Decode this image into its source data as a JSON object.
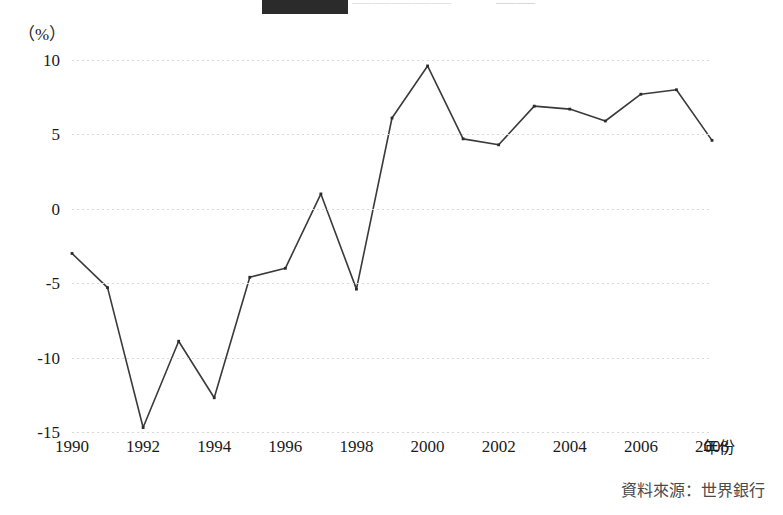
{
  "figure": {
    "unit_label": "（%）",
    "x_axis_name": "年份",
    "source_note": "資料來源：世界銀行",
    "title_fragment_visible": "",
    "line_color": "#3a3a3a",
    "marker_color": "#2b2b2b",
    "grid_color": "#d9d9d9",
    "background": "#ffffff"
  },
  "chart_data": {
    "type": "line",
    "title": "",
    "xlabel": "年份",
    "ylabel": "（%）",
    "ylim": [
      -15,
      10
    ],
    "xlim": [
      1990,
      2008
    ],
    "grid": true,
    "legend": "none",
    "yticks": [
      10,
      5,
      0,
      -5,
      -10,
      -15
    ],
    "ytick_labels": [
      "10",
      "5",
      "0",
      "-5",
      "-10",
      "-15"
    ],
    "xticks": [
      1990,
      1992,
      1994,
      1996,
      1998,
      2000,
      2002,
      2004,
      2006,
      2008
    ],
    "xtick_labels": [
      "1990",
      "1992",
      "1994",
      "1996",
      "1998",
      "2000",
      "2002",
      "2004",
      "2006",
      "2008"
    ],
    "x": [
      1990,
      1991,
      1992,
      1993,
      1994,
      1995,
      1996,
      1997,
      1998,
      1999,
      2000,
      2001,
      2002,
      2003,
      2004,
      2005,
      2006,
      2007,
      2008
    ],
    "values": [
      -3.0,
      -5.3,
      -14.7,
      -8.9,
      -12.7,
      -4.6,
      -4.0,
      1.0,
      -5.4,
      6.1,
      9.6,
      4.7,
      4.3,
      6.9,
      6.7,
      5.9,
      7.7,
      8.0,
      4.6
    ],
    "series": [
      {
        "name": "GDP 成長率",
        "values": [
          -3.0,
          -5.3,
          -14.7,
          -8.9,
          -12.7,
          -4.6,
          -4.0,
          1.0,
          -5.4,
          6.1,
          9.6,
          4.7,
          4.3,
          6.9,
          6.7,
          5.9,
          7.7,
          8.0,
          4.6
        ]
      }
    ],
    "source": "資料來源：世界銀行"
  }
}
